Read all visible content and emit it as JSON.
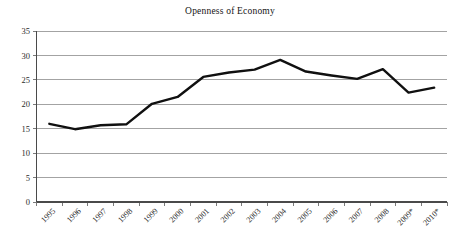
{
  "chart_data": {
    "type": "line",
    "title": "Openness of Economy",
    "xlabel": "",
    "ylabel": "",
    "categories": [
      "1995",
      "1996",
      "1997",
      "1998",
      "1999",
      "2000",
      "2001",
      "2002",
      "2003",
      "2004",
      "2005",
      "2006",
      "2007",
      "2008",
      "2009*",
      "2010*"
    ],
    "values": [
      16.0,
      14.9,
      15.7,
      15.9,
      20.1,
      21.5,
      25.6,
      26.5,
      27.1,
      29.1,
      26.7,
      25.9,
      25.2,
      27.2,
      22.4,
      23.4
    ],
    "series": [
      {
        "name": "Openness of Economy",
        "values": [
          16.0,
          14.9,
          15.7,
          15.9,
          20.1,
          21.5,
          25.6,
          26.5,
          27.1,
          29.1,
          26.7,
          25.9,
          25.2,
          27.2,
          22.4,
          23.4
        ]
      }
    ],
    "ylim": [
      0,
      35
    ],
    "yticks": [
      0,
      5,
      10,
      15,
      20,
      25,
      30,
      35
    ],
    "ytick_labels": [
      "0",
      "5",
      "10",
      "15",
      "20",
      "25",
      "30",
      "35"
    ],
    "grid": true,
    "grid_axis": "y",
    "legend": false,
    "legend_position": "none",
    "xtick_rotation": 45,
    "line_color": "#101010",
    "grid_color": "#8c8c8c",
    "axis_color": "#4a4a4a",
    "background": "#ffffff",
    "annotations": [
      "* indicates estimated or projected values for 2009 and 2010"
    ]
  },
  "figure": {
    "title": "Openness of Economy"
  }
}
